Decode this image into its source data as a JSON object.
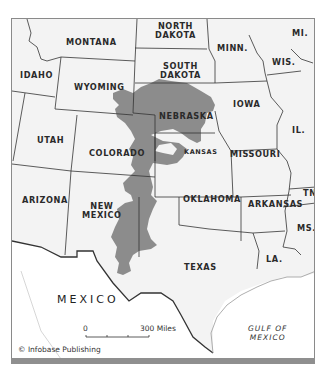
{
  "map": {
    "title": "",
    "region_color": "#8c8c8c",
    "land_color": "#f3f3f3",
    "mexico_color": "#ffffff",
    "water_color": "#ffffff",
    "states": {
      "montana": "MONTANA",
      "north_dakota": "NORTH\nDAKOTA",
      "minnesota": "MINN.",
      "michigan": "MI.",
      "idaho": "IDAHO",
      "wyoming": "WYOMING",
      "south_dakota": "SOUTH\nDAKOTA",
      "wisconsin": "WIS.",
      "nebraska": "NEBRASKA",
      "iowa": "IOWA",
      "illinois": "IL.",
      "utah": "UTAH",
      "colorado": "COLORADO",
      "kansas": "KANSAS",
      "missouri": "MISSOURI",
      "arizona": "ARIZONA",
      "new_mexico": "NEW\nMEXICO",
      "oklahoma": "OKLAHOMA",
      "arkansas": "ARKANSAS",
      "tennessee": "TN",
      "mississippi": "MS.",
      "texas": "TEXAS",
      "louisiana": "LA."
    },
    "countries": {
      "mexico": "MEXICO"
    },
    "water": {
      "gulf": "GULF OF\nMEXICO"
    },
    "scale": {
      "start": "0",
      "end": "300 Miles"
    },
    "credit": "© Infobase Publishing"
  }
}
